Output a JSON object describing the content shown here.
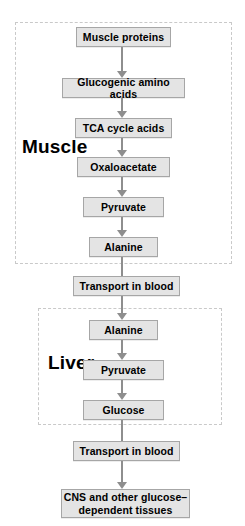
{
  "figure": {
    "type": "flowchart"
  },
  "regions": [
    {
      "id": "muscle",
      "label": "Muscle"
    },
    {
      "id": "liver",
      "label": "Liver"
    }
  ],
  "nodes": [
    {
      "id": "muscle-proteins",
      "label": "Muscle proteins",
      "region": "muscle"
    },
    {
      "id": "glucogenic-amino-acids",
      "label": "Glucogenic amino acids",
      "region": "muscle"
    },
    {
      "id": "tca-cycle-acids",
      "label": "TCA cycle acids",
      "region": "muscle"
    },
    {
      "id": "oxaloacetate",
      "label": "Oxaloacetate",
      "region": "muscle"
    },
    {
      "id": "pyruvate-muscle",
      "label": "Pyruvate",
      "region": "muscle"
    },
    {
      "id": "alanine-muscle",
      "label": "Alanine",
      "region": "muscle"
    },
    {
      "id": "transport-in-blood-1",
      "label": "Transport in blood",
      "region": "none"
    },
    {
      "id": "alanine-liver",
      "label": "Alanine",
      "region": "liver"
    },
    {
      "id": "pyruvate-liver",
      "label": "Pyruvate",
      "region": "liver"
    },
    {
      "id": "glucose",
      "label": "Glucose",
      "region": "liver"
    },
    {
      "id": "transport-in-blood-2",
      "label": "Transport in blood",
      "region": "none"
    },
    {
      "id": "cns-tissues",
      "label_line1": "CNS and other glucose–",
      "label_line2": "dependent tissues",
      "region": "none"
    }
  ],
  "edges": [
    {
      "from": "muscle-proteins",
      "to": "glucogenic-amino-acids"
    },
    {
      "from": "glucogenic-amino-acids",
      "to": "tca-cycle-acids"
    },
    {
      "from": "tca-cycle-acids",
      "to": "oxaloacetate"
    },
    {
      "from": "oxaloacetate",
      "to": "pyruvate-muscle"
    },
    {
      "from": "pyruvate-muscle",
      "to": "alanine-muscle"
    },
    {
      "from": "alanine-muscle",
      "to": "transport-in-blood-1"
    },
    {
      "from": "transport-in-blood-1",
      "to": "alanine-liver"
    },
    {
      "from": "alanine-liver",
      "to": "pyruvate-liver"
    },
    {
      "from": "pyruvate-liver",
      "to": "glucose"
    },
    {
      "from": "glucose",
      "to": "transport-in-blood-2"
    },
    {
      "from": "transport-in-blood-2",
      "to": "cns-tissues"
    }
  ],
  "colors": {
    "node_fill": "#e4e4e4",
    "node_border": "#a6a6a6",
    "arrow": "#8e8e8e",
    "region_border": "#c9c9c9",
    "text": "#000000",
    "background": "#ffffff"
  }
}
